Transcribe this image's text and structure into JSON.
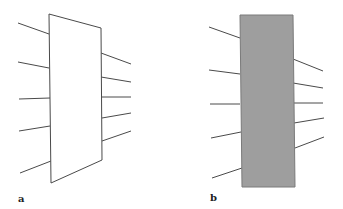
{
  "colors": {
    "stroke": "#4a4a4a",
    "panel_a_fill": "#ffffff",
    "panel_b_fill": "#9e9e9e",
    "panel_b_edge": "#7a7a7a"
  },
  "panels": [
    {
      "label": "a",
      "shape": "parallelogram",
      "polygon": "49,14 101,28 102,160 51,183",
      "label_pos": [
        18,
        202
      ],
      "left_lines": [
        [
          18,
          23,
          49,
          34
        ],
        [
          18,
          62,
          49,
          68
        ],
        [
          19,
          99,
          50,
          98
        ],
        [
          19,
          131,
          50,
          126
        ],
        [
          20,
          173,
          51,
          161
        ]
      ],
      "right_lines": [
        [
          101,
          53,
          131,
          64
        ],
        [
          101,
          77,
          131,
          82
        ],
        [
          101,
          97,
          131,
          97
        ],
        [
          102,
          118,
          131,
          113
        ],
        [
          102,
          141,
          131,
          131
        ]
      ]
    },
    {
      "label": "b",
      "shape": "rectangle",
      "polygon": "240,15 293,15 295,187 242,187",
      "label_pos": [
        210,
        201
      ],
      "left_lines": [
        [
          209,
          27,
          240,
          38
        ],
        [
          209,
          70,
          240,
          74
        ],
        [
          210,
          104,
          240,
          104
        ],
        [
          211,
          138,
          241,
          132
        ],
        [
          212,
          178,
          242,
          168
        ]
      ],
      "right_lines": [
        [
          293,
          59,
          323,
          71
        ],
        [
          293,
          83,
          323,
          88
        ],
        [
          294,
          103,
          323,
          103
        ],
        [
          294,
          123,
          324,
          118
        ],
        [
          295,
          148,
          324,
          137
        ]
      ]
    }
  ]
}
